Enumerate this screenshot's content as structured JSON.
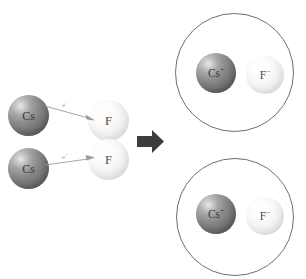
{
  "figure": {
    "background_color": "#ffffff"
  },
  "colors": {
    "cesium_sphere": "#7c7c7c",
    "fluorine_sphere": "#f1f1f1",
    "label_text": "#3a3a3a",
    "electron_label": "#a8a8a8",
    "arrow_fill": "#3d3d3d",
    "circle_stroke": "#6f6f6f"
  },
  "reactants": {
    "cesium_atoms": [
      {
        "label": "Cs",
        "charge": ""
      },
      {
        "label": "Cs",
        "charge": ""
      }
    ],
    "fluorine_atoms": [
      {
        "label": "F",
        "charge": ""
      },
      {
        "label": "F",
        "charge": ""
      }
    ],
    "electron_transfers": [
      {
        "label": "e",
        "charge": "−",
        "direction": "cesium-to-fluorine"
      },
      {
        "label": "e",
        "charge": "−",
        "direction": "cesium-to-fluorine"
      }
    ]
  },
  "reaction_arrow": {
    "direction": "right",
    "shape": "block-arrow"
  },
  "products": {
    "ion_pairs": [
      {
        "cation": {
          "label": "Cs",
          "charge": "+"
        },
        "anion": {
          "label": "F",
          "charge": "−"
        }
      },
      {
        "cation": {
          "label": "Cs",
          "charge": "+"
        },
        "anion": {
          "label": "F",
          "charge": "−"
        }
      }
    ]
  }
}
